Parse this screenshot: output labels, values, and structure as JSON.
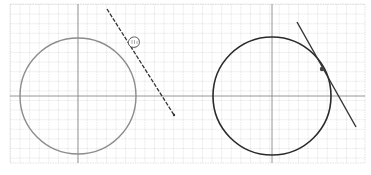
{
  "figure": {
    "description": "Two grid panels: left shows a circle with a line and a hand cursor moving it; right shows the line snapped tangent to the circle",
    "colors": {
      "grid_minor": "#c8c8c8",
      "grid_axis": "#8a8a8a",
      "left_circle": "#8c8c8c",
      "right_circle": "#2a2a2a",
      "line": "#333333",
      "cursor": "#555555"
    },
    "left_panel": {
      "label": "Before: line being dragged",
      "circle": {
        "cx": 78,
        "cy": 96,
        "r": 58
      },
      "line": {
        "x1": 107,
        "y1": 9,
        "x2": 174,
        "y2": 115
      },
      "cursor": "hand-cursor"
    },
    "right_panel": {
      "label": "After: line tangent to circle",
      "circle": {
        "cx": 272,
        "cy": 96,
        "r": 59
      },
      "line": {
        "x1": 297,
        "y1": 22,
        "x2": 356,
        "y2": 127
      },
      "tangent_point": {
        "x": 322,
        "y": 69
      }
    }
  }
}
